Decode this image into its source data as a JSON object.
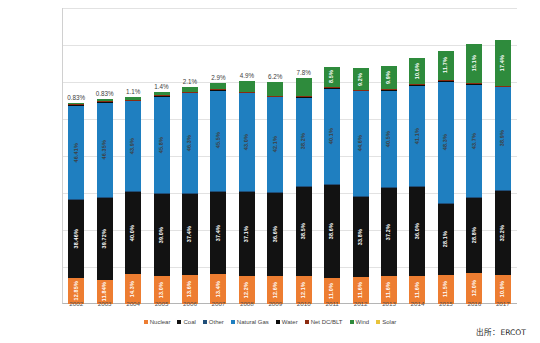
{
  "source_note": "出所：ERCOT",
  "chart_data": {
    "type": "bar",
    "subtype": "stacked-bar",
    "title": "",
    "xlabel": "",
    "ylabel": "",
    "ylim": [
      0,
      400000000
    ],
    "ytick_values": [
      0,
      50000000,
      100000000,
      150000000,
      200000000,
      250000000,
      300000000,
      350000000,
      400000000
    ],
    "ytick_labels": [
      "0",
      "50,000,000",
      "100,000,000",
      "150,000,000",
      "200,000,000",
      "250,000,000",
      "300,000,000",
      "350,000,000",
      "400,000,000"
    ],
    "grid": true,
    "legend_position": "bottom",
    "categories": [
      "2002",
      "2003",
      "2004",
      "2005",
      "2006",
      "2007",
      "2008",
      "2009",
      "2010",
      "2011",
      "2012",
      "2013",
      "2014",
      "2015",
      "2016",
      "2017"
    ],
    "series": [
      {
        "name": "Nuclear",
        "color": "#ED7D31",
        "values": [
          35200000,
          32900000,
          39900000,
          37200000,
          39800000,
          40100000,
          37600000,
          38500000,
          38000000,
          35700000,
          37000000,
          37400000,
          38500000,
          39300000,
          42100000,
          38900000
        ],
        "labels": [
          "12.85%",
          "11.84%",
          "14.3%",
          "13.0%",
          "13.6%",
          "13.4%",
          "12.2%",
          "12.6%",
          "12.1%",
          "11.0%",
          "11.6%",
          "11.6%",
          "11.6%",
          "11.5%",
          "12.0%",
          "10.9%"
        ]
      },
      {
        "name": "Coal",
        "color": "#121212",
        "values": [
          105400000,
          110300000,
          111600000,
          111600000,
          109500000,
          112000000,
          114300000,
          111900000,
          120800000,
          125200000,
          107800000,
          119900000,
          119700000,
          96000000,
          101000000,
          114900000
        ],
        "labels": [
          "38.46%",
          "39.72%",
          "40.0%",
          "39.0%",
          "37.4%",
          "37.4%",
          "37.1%",
          "36.6%",
          "38.5%",
          "38.6%",
          "33.8%",
          "37.2%",
          "36.0%",
          "28.1%",
          "28.8%",
          "32.2%"
        ]
      },
      {
        "name": "Other",
        "color": "#1F4E79",
        "values": [
          900000,
          900000,
          900000,
          900000,
          900000,
          900000,
          900000,
          900000,
          900000,
          900000,
          900000,
          900000,
          900000,
          900000,
          900000,
          900000
        ],
        "labels": [
          "",
          "",
          "",
          "",
          "",
          "",
          "",
          "",
          "",
          "",
          "",
          "",
          "",
          "",
          "",
          ""
        ]
      },
      {
        "name": "Natural Gas",
        "color": "#1F7FC0",
        "values": [
          127200000,
          128800000,
          122500000,
          131100000,
          135600000,
          136200000,
          132500000,
          128700000,
          119900000,
          130100000,
          142300000,
          130500000,
          136700000,
          165000000,
          153300000,
          138800000
        ],
        "labels": [
          "46.41%",
          "46.35%",
          "43.9%",
          "45.8%",
          "46.3%",
          "45.5%",
          "43.0%",
          "42.1%",
          "38.2%",
          "40.1%",
          "44.6%",
          "40.5%",
          "41.1%",
          "48.3%",
          "43.7%",
          "38.9%"
        ]
      },
      {
        "name": "Water",
        "color": "#0B0B0B",
        "values": [
          700000,
          700000,
          700000,
          700000,
          700000,
          700000,
          700000,
          700000,
          700000,
          700000,
          700000,
          700000,
          700000,
          700000,
          700000,
          700000
        ],
        "labels": [
          "",
          "",
          "",
          "",
          "",
          "",
          "",
          "",
          "",
          "",
          "",
          "",
          "",
          "",
          "",
          ""
        ]
      },
      {
        "name": "Net DC/BLT",
        "color": "#8C2B10",
        "values": [
          600000,
          600000,
          600000,
          600000,
          600000,
          600000,
          600000,
          600000,
          600000,
          600000,
          600000,
          600000,
          600000,
          600000,
          600000,
          600000
        ],
        "labels": [
          "",
          "",
          "",
          "",
          "",
          "",
          "",
          "",
          "",
          "",
          "",
          "",
          "",
          "",
          "",
          ""
        ]
      },
      {
        "name": "Wind",
        "color": "#2E8B3C",
        "values": [
          2300000,
          2300000,
          3100000,
          4000000,
          6100000,
          8700000,
          15100000,
          19000000,
          24500000,
          27600000,
          29400000,
          31900000,
          35300000,
          40000000,
          53000000,
          62100000
        ],
        "labels": [
          "0.83%",
          "0.83%",
          "1.1%",
          "1.4%",
          "2.1%",
          "2.9%",
          "4.9%",
          "6.2%",
          "7.8%",
          "8.5%",
          "9.2%",
          "9.9%",
          "10.6%",
          "11.7%",
          "15.1%",
          "17.4%"
        ],
        "label_outside": [
          true,
          true,
          true,
          true,
          true,
          true,
          true,
          true,
          true,
          false,
          false,
          false,
          false,
          false,
          false,
          false
        ]
      },
      {
        "name": "Solar",
        "color": "#E8C33A",
        "values": [
          0,
          0,
          0,
          0,
          0,
          0,
          0,
          0,
          0,
          0,
          0,
          0,
          0,
          0,
          0,
          0
        ],
        "labels": [
          "",
          "",
          "",
          "",
          "",
          "",
          "",
          "",
          "",
          "",
          "",
          "",
          "",
          "",
          "",
          ""
        ]
      }
    ]
  }
}
